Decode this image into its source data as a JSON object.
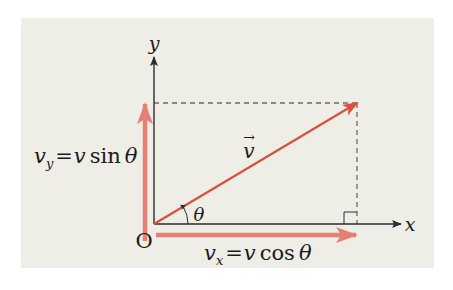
{
  "diagram": {
    "colors": {
      "panel_bg": "#efeee6",
      "axis": "#2b2b33",
      "vector": "#d9503f",
      "component": "#e58077",
      "dashed": "#6a6a6a"
    },
    "axes": {
      "x_label": "x",
      "y_label": "y",
      "origin_label": "O"
    },
    "vector": {
      "symbol": "v",
      "arrow_accent": "→"
    },
    "angle": {
      "symbol": "θ"
    },
    "components": {
      "vy": {
        "lhs_base": "v",
        "lhs_sub": "y",
        "equals": "=",
        "rhs_var": "v",
        "rhs_func": "sin",
        "rhs_angle": "θ"
      },
      "vx": {
        "lhs_base": "v",
        "lhs_sub": "x",
        "equals": "=",
        "rhs_var": "v",
        "rhs_func": "cos",
        "rhs_angle": "θ"
      }
    }
  }
}
